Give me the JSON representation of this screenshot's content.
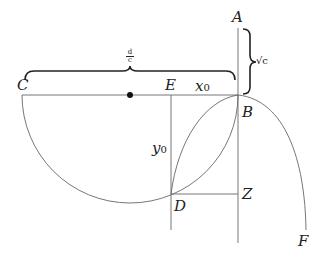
{
  "diagram": {
    "type": "geometric construction",
    "points": {
      "A": "A",
      "B": "B",
      "C": "C",
      "D": "D",
      "E": "E",
      "F": "F",
      "Z": "Z"
    },
    "labels": {
      "x0_var": "x",
      "x0_sub": "0",
      "y0_var": "y",
      "y0_sub": "0",
      "d_over_c_num": "d",
      "d_over_c_den": "c",
      "sqrt_c": "√c"
    },
    "colors": {
      "line": "#555555",
      "brace": "#222222",
      "center_dot": "#111111"
    }
  }
}
